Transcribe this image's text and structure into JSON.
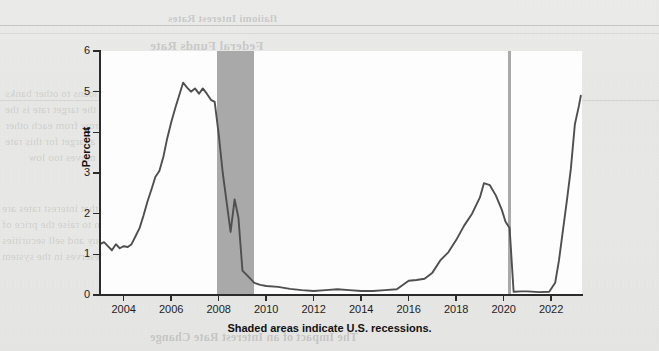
{
  "page": {
    "background_color": "#e9e9e7",
    "kind": "scanned-textbook-page",
    "bleed_through_lines": [
      "flaiiomi Interest Rates",
      "Federal Funds Rate",
      "tilt ilicinu",
      "These lenders provide loans to other banks",
      "that The lederal reserve the target rate is the",
      "rate at which banks borrow from each other",
      "overnight. The Fed sets a target for this rate",
      "the market, or when the rate moves too low",
      "FOMC",
      "When the Fed believes that interest rates are",
      "too high it takes action to raise the price of",
      "money. The Fed can buy and sell securities",
      "to change the level of reserves in the system",
      "The Impact of an Interest Rate Change"
    ]
  },
  "chart": {
    "ylabel": "Percent",
    "caption": "Shaded areas indicate U.S. recessions.",
    "line_color": "#4f4f4f",
    "recession_color": "#a9a9a9",
    "plot_background": "#fdfdfd",
    "axis_color": "#2b2b2b"
  },
  "chart_data": {
    "type": "line",
    "title": "",
    "subtitle": "",
    "xlabel": "",
    "ylabel": "Percent",
    "annotations": [
      "Shaded areas indicate U.S. recessions."
    ],
    "grid": false,
    "legend": null,
    "xlim": [
      2003.0,
      2023.3
    ],
    "ylim": [
      0,
      6
    ],
    "yticks": [
      0,
      1,
      2,
      3,
      4,
      5,
      6
    ],
    "xticks": [
      2004,
      2006,
      2008,
      2010,
      2012,
      2014,
      2016,
      2018,
      2020,
      2022
    ],
    "xtick_labels": [
      "2004",
      "2006",
      "2008",
      "2010",
      "2012",
      "2014",
      "2016",
      "2018",
      "2020",
      "2022"
    ],
    "ytick_labels": [
      "0",
      "1",
      "2",
      "3",
      "4",
      "5",
      "6"
    ],
    "shaded_regions": [
      {
        "label": "U.S. recession 2007-2009",
        "x0": 2007.92,
        "x1": 2009.5,
        "color": "#a9a9a9"
      },
      {
        "label": "U.S. recession 2020",
        "x0": 2020.17,
        "x1": 2020.33,
        "color": "#a9a9a9"
      }
    ],
    "series": [
      {
        "name": "Federal Funds Rate",
        "color": "#4f4f4f",
        "x": [
          2003.0,
          2003.17,
          2003.33,
          2003.5,
          2003.67,
          2003.83,
          2004.0,
          2004.17,
          2004.33,
          2004.5,
          2004.67,
          2004.83,
          2005.0,
          2005.17,
          2005.33,
          2005.5,
          2005.67,
          2005.83,
          2006.0,
          2006.17,
          2006.33,
          2006.5,
          2006.67,
          2006.83,
          2007.0,
          2007.17,
          2007.33,
          2007.5,
          2007.67,
          2007.83,
          2008.0,
          2008.17,
          2008.33,
          2008.5,
          2008.67,
          2008.83,
          2009.0,
          2009.25,
          2009.5,
          2009.75,
          2010.0,
          2010.5,
          2011.0,
          2011.5,
          2012.0,
          2012.5,
          2013.0,
          2013.5,
          2014.0,
          2014.5,
          2015.0,
          2015.5,
          2016.0,
          2016.33,
          2016.67,
          2017.0,
          2017.33,
          2017.67,
          2018.0,
          2018.33,
          2018.67,
          2019.0,
          2019.17,
          2019.42,
          2019.67,
          2019.92,
          2020.08,
          2020.25,
          2020.42,
          2020.75,
          2021.0,
          2021.5,
          2021.92,
          2022.17,
          2022.33,
          2022.5,
          2022.67,
          2022.83,
          2023.0,
          2023.17,
          2023.25
        ],
        "y": [
          1.25,
          1.3,
          1.2,
          1.1,
          1.25,
          1.15,
          1.2,
          1.18,
          1.25,
          1.45,
          1.65,
          1.95,
          2.3,
          2.6,
          2.9,
          3.05,
          3.4,
          3.85,
          4.25,
          4.6,
          4.9,
          5.22,
          5.1,
          5.0,
          5.08,
          4.95,
          5.08,
          4.95,
          4.8,
          4.75,
          3.95,
          3.0,
          2.3,
          1.55,
          2.35,
          1.9,
          0.6,
          0.45,
          0.3,
          0.25,
          0.22,
          0.2,
          0.15,
          0.12,
          0.1,
          0.12,
          0.14,
          0.12,
          0.1,
          0.1,
          0.12,
          0.14,
          0.35,
          0.37,
          0.4,
          0.55,
          0.85,
          1.05,
          1.35,
          1.7,
          2.0,
          2.4,
          2.75,
          2.7,
          2.45,
          2.1,
          1.8,
          1.65,
          0.08,
          0.09,
          0.09,
          0.07,
          0.08,
          0.3,
          0.85,
          1.6,
          2.35,
          3.1,
          4.2,
          4.65,
          4.9
        ]
      }
    ]
  }
}
